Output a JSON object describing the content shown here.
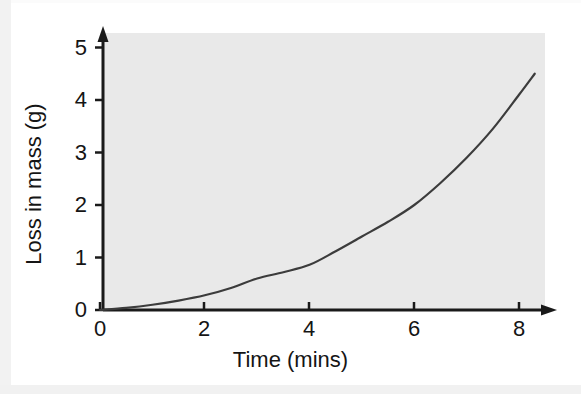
{
  "chart_data": {
    "type": "line",
    "title": "",
    "subtitle": "",
    "xlabel": "Time (mins)",
    "ylabel": "Loss in mass (g)",
    "xlim": [
      0,
      8
    ],
    "ylim": [
      0,
      5
    ],
    "xticks": [
      "0",
      "2",
      "4",
      "6",
      "8"
    ],
    "xtick_values": [
      0,
      2,
      4,
      6,
      8
    ],
    "yticks": [
      "0",
      "1",
      "2",
      "3",
      "4",
      "5"
    ],
    "ytick_values": [
      0,
      1,
      2,
      3,
      4,
      5
    ],
    "grid": false,
    "legend": null,
    "legend_position": "none",
    "annotations": [],
    "axis_style": "arrow-terminated",
    "plot_background": "#e9e9e9",
    "line_color": "#3c3c3c",
    "series": [
      {
        "name": "Loss in mass",
        "x": [
          0,
          0.5,
          1,
          1.5,
          2,
          2.5,
          3,
          3.5,
          4,
          4.5,
          5,
          5.5,
          6,
          6.5,
          7,
          7.5,
          8,
          8.3
        ],
        "values": [
          0,
          0.04,
          0.1,
          0.18,
          0.28,
          0.42,
          0.6,
          0.72,
          0.86,
          1.12,
          1.4,
          1.68,
          2.0,
          2.42,
          2.9,
          3.45,
          4.1,
          4.5
        ]
      }
    ]
  },
  "axes": {
    "x_title": "Time (mins)",
    "y_title": "Loss in mass (g)",
    "x_tick_labels": [
      "0",
      "2",
      "4",
      "6",
      "8"
    ],
    "y_tick_labels": [
      "0",
      "1",
      "2",
      "3",
      "4",
      "5"
    ]
  },
  "colors": {
    "plot_background": "#e9e9e9",
    "axis": "#1a1a1a",
    "curve": "#3c3c3c",
    "text": "#151515",
    "page_background": "#ffffff"
  }
}
